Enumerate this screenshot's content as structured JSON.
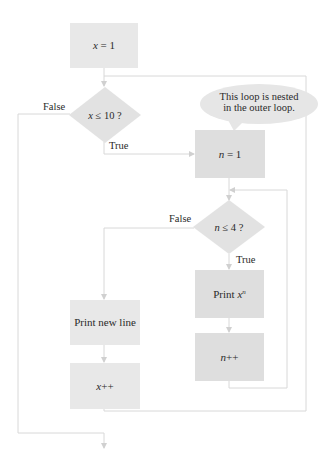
{
  "diagram": {
    "type": "flowchart",
    "colors": {
      "box_fill": "#e8e8e8",
      "box_fill_inner": "#dedede",
      "diamond_fill": "#e2e2e2",
      "connector": "#d6d6d6",
      "callout_fill": "#e6e6e6",
      "text": "#2a2a2a"
    },
    "nodes": {
      "init_x": {
        "var": "x",
        "op": " = ",
        "value": "1"
      },
      "outer_condition": {
        "var": "x",
        "op": " ≤ ",
        "value": "10 ?"
      },
      "init_n": {
        "var": "n",
        "op": " = ",
        "value": "1"
      },
      "inner_condition": {
        "var": "n",
        "op": " ≤ ",
        "value": "4 ?"
      },
      "print_power": {
        "prefix": "Print ",
        "base": "x",
        "exponent": "n"
      },
      "increment_n": {
        "var": "n",
        "op": "++"
      },
      "print_newline": {
        "text": "Print new line"
      },
      "increment_x": {
        "var": "x",
        "op": "++"
      }
    },
    "branch_labels": {
      "outer_false": "False",
      "outer_true": "True",
      "inner_false": "False",
      "inner_true": "True"
    },
    "callout": {
      "line1": "This loop is nested",
      "line2": "in the outer loop."
    }
  }
}
